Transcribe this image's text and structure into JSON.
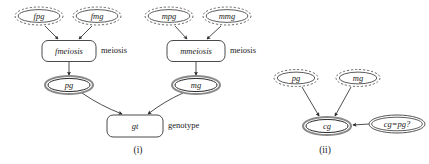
{
  "figure": {
    "background_color": "#ffffff",
    "ink_color": "#1a1a1a",
    "width": 429,
    "height": 164
  },
  "captions": [
    {
      "id": "caption-i",
      "text": "(i)",
      "x": 138,
      "y": 151,
      "size": 9.5
    },
    {
      "id": "caption-ii",
      "text": "(ii)",
      "x": 325,
      "y": 151,
      "size": 9.5
    }
  ],
  "panel_i": {
    "name": "panel-i-meiosis-genotype",
    "nodes": [
      {
        "id": "fpg",
        "label": "fpg",
        "shape": "scalloped-ellipse",
        "cx": 39,
        "cy": 16,
        "rx": 24,
        "ry": 9,
        "size": 8.5
      },
      {
        "id": "fmg",
        "label": "fmg",
        "shape": "scalloped-ellipse",
        "cx": 97,
        "cy": 16,
        "rx": 24,
        "ry": 9,
        "size": 8.5
      },
      {
        "id": "mpg",
        "label": "mpg",
        "shape": "scalloped-ellipse",
        "cx": 169,
        "cy": 16,
        "rx": 24,
        "ry": 9,
        "size": 8.5
      },
      {
        "id": "mmg",
        "label": "mmg",
        "shape": "scalloped-ellipse",
        "cx": 227,
        "cy": 16,
        "rx": 24,
        "ry": 9,
        "size": 8.5
      },
      {
        "id": "fmeiosis",
        "label": "fmeiosis",
        "shape": "rounded-rect",
        "cx": 69,
        "cy": 51,
        "w": 54,
        "h": 21,
        "r": 6,
        "size": 8.5
      },
      {
        "id": "mmeiosis",
        "label": "mmeiosis",
        "shape": "rounded-rect",
        "cx": 196,
        "cy": 51,
        "w": 58,
        "h": 21,
        "r": 6,
        "size": 8.5
      },
      {
        "id": "pg",
        "label": "pg",
        "shape": "bold-ellipse",
        "cx": 69,
        "cy": 85,
        "rx": 24,
        "ry": 9,
        "size": 8.5
      },
      {
        "id": "mg",
        "label": "mg",
        "shape": "bold-ellipse",
        "cx": 196,
        "cy": 85,
        "rx": 24,
        "ry": 9,
        "size": 8.5
      },
      {
        "id": "gt",
        "label": "gt",
        "shape": "rounded-rect",
        "cx": 135,
        "cy": 126,
        "w": 56,
        "h": 22,
        "r": 6,
        "size": 8.5
      }
    ],
    "annotations": [
      {
        "id": "fmeiosis-type",
        "text": "meiosis",
        "x": 101,
        "y": 51,
        "size": 8.5
      },
      {
        "id": "mmeiosis-type",
        "text": "meiosis",
        "x": 230,
        "y": 51,
        "size": 8.5
      },
      {
        "id": "gt-type",
        "text": "genotype",
        "x": 168,
        "y": 126,
        "size": 8.5
      }
    ],
    "edges": [
      {
        "id": "fpg-to-fmeiosis",
        "from": "fpg",
        "to": "fmeiosis",
        "x1": 45,
        "y1": 26,
        "x2": 58,
        "y2": 39
      },
      {
        "id": "fmg-to-fmeiosis",
        "from": "fmg",
        "to": "fmeiosis",
        "x1": 92,
        "y1": 26,
        "x2": 79,
        "y2": 39
      },
      {
        "id": "mpg-to-mmeiosis",
        "from": "mpg",
        "to": "mmeiosis",
        "x1": 175,
        "y1": 26,
        "x2": 187,
        "y2": 39
      },
      {
        "id": "mmg-to-mmeiosis",
        "from": "mmg",
        "to": "mmeiosis",
        "x1": 221,
        "y1": 26,
        "x2": 207,
        "y2": 39
      },
      {
        "id": "fmeiosis-to-pg",
        "from": "fmeiosis",
        "to": "pg",
        "x1": 69,
        "y1": 62,
        "x2": 69,
        "y2": 75
      },
      {
        "id": "mmeiosis-to-mg",
        "from": "mmeiosis",
        "to": "mg",
        "x1": 196,
        "y1": 62,
        "x2": 196,
        "y2": 75
      },
      {
        "id": "pg-to-gt",
        "from": "pg",
        "to": "gt",
        "x1": 82,
        "y1": 93,
        "x2": 122,
        "y2": 114
      },
      {
        "id": "mg-to-gt",
        "from": "mg",
        "to": "gt",
        "x1": 183,
        "y1": 93,
        "x2": 148,
        "y2": 114
      }
    ]
  },
  "panel_ii": {
    "name": "panel-ii-constraint",
    "nodes": [
      {
        "id": "pg2",
        "label": "pg",
        "shape": "scalloped-ellipse",
        "cx": 296,
        "cy": 78,
        "rx": 22,
        "ry": 8.5,
        "size": 8.5
      },
      {
        "id": "mg2",
        "label": "mg",
        "shape": "scalloped-ellipse",
        "cx": 358,
        "cy": 78,
        "rx": 22,
        "ry": 8.5,
        "size": 8.5
      },
      {
        "id": "cg",
        "label": "cg",
        "shape": "bold-ellipse",
        "cx": 327,
        "cy": 126,
        "rx": 24,
        "ry": 9,
        "size": 8.5
      },
      {
        "id": "cgpg",
        "label": "cg=pg?",
        "shape": "plain-ellipse",
        "cx": 397,
        "cy": 124,
        "rx": 28,
        "ry": 9,
        "size": 8.5
      }
    ],
    "annotations": [],
    "edges": [
      {
        "id": "pg2-to-cg",
        "from": "pg2",
        "to": "cg",
        "x1": 302,
        "y1": 87,
        "x2": 319,
        "y2": 116
      },
      {
        "id": "mg2-to-cg",
        "from": "mg2",
        "to": "cg",
        "x1": 351,
        "y1": 87,
        "x2": 335,
        "y2": 116
      },
      {
        "id": "cgpg-to-cg",
        "from": "cgpg",
        "to": "cg",
        "x1": 369,
        "y1": 124,
        "x2": 353,
        "y2": 125
      }
    ]
  }
}
